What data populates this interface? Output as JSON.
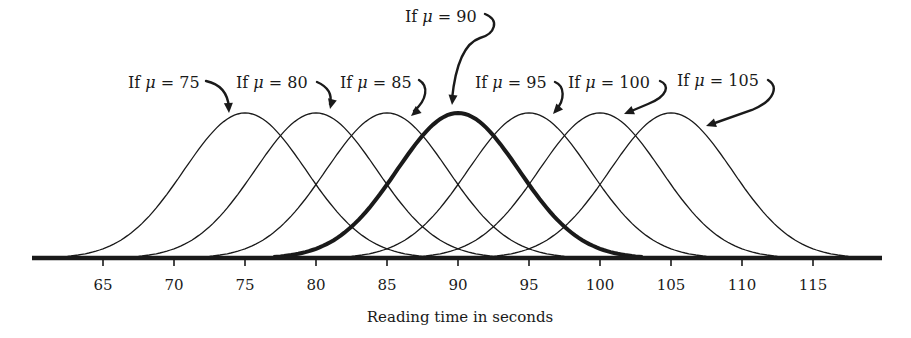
{
  "chart_data": {
    "type": "line",
    "title": "",
    "xlabel": "Reading time in seconds",
    "ylabel": "",
    "xlim": [
      60,
      120
    ],
    "x_ticks": [
      65,
      70,
      75,
      80,
      85,
      90,
      95,
      100,
      105,
      110,
      115
    ],
    "grid": false,
    "legend": "none",
    "sd": 4.3,
    "support_halfwidth": 13,
    "series": [
      {
        "name": "If μ = 75",
        "mean": 75,
        "highlight": false
      },
      {
        "name": "If μ = 80",
        "mean": 80,
        "highlight": false
      },
      {
        "name": "If μ = 85",
        "mean": 85,
        "highlight": false
      },
      {
        "name": "If μ = 90",
        "mean": 90,
        "highlight": true
      },
      {
        "name": "If μ = 95",
        "mean": 95,
        "highlight": false
      },
      {
        "name": "If μ = 100",
        "mean": 100,
        "highlight": false
      },
      {
        "name": "If μ = 105",
        "mean": 105,
        "highlight": false
      }
    ],
    "annotations": [
      {
        "prefix": "If ",
        "symbol": "μ",
        "suffix": " = 75",
        "x": 128,
        "y": 88
      },
      {
        "prefix": "If ",
        "symbol": "μ",
        "suffix": " = 80",
        "x": 236,
        "y": 88
      },
      {
        "prefix": "If ",
        "symbol": "μ",
        "suffix": " = 85",
        "x": 340,
        "y": 88
      },
      {
        "prefix": "If ",
        "symbol": "μ",
        "suffix": " = 90",
        "x": 405,
        "y": 22
      },
      {
        "prefix": "If ",
        "symbol": "μ",
        "suffix": " = 95",
        "x": 475,
        "y": 88
      },
      {
        "prefix": "If ",
        "symbol": "μ",
        "suffix": " = 100",
        "x": 568,
        "y": 88
      },
      {
        "prefix": "If ",
        "symbol": "μ",
        "suffix": " = 105",
        "x": 677,
        "y": 86
      }
    ]
  },
  "colors": {
    "ink": "#1a1a1a",
    "background": "#ffffff"
  }
}
